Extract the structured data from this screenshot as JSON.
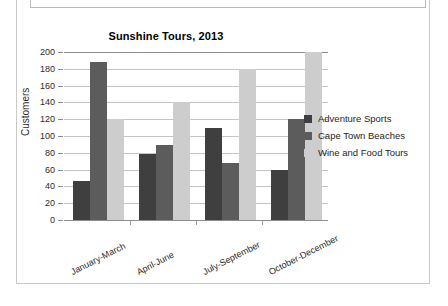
{
  "document": {
    "frame_label": "document-frame",
    "top_strip_label": "empty-text-box"
  },
  "chart_data": {
    "type": "bar",
    "title": "Sunshine Tours, 2013",
    "xlabel": "",
    "ylabel": "Customers",
    "ylim": [
      0,
      200
    ],
    "ytick_step": 20,
    "yticks": [
      "200",
      "180",
      "160",
      "140",
      "120",
      "100",
      "80",
      "60",
      "40",
      "20",
      "0"
    ],
    "grid": true,
    "legend_position": "right",
    "categories": [
      "January-March",
      "April-June",
      "July-September",
      "October-December"
    ],
    "series": [
      {
        "name": "Adventure Sports",
        "color": "#3f3f3f",
        "values": [
          46,
          78,
          109,
          59
        ]
      },
      {
        "name": "Cape Town Beaches",
        "color": "#5c5c5c",
        "values": [
          188,
          89,
          68,
          120
        ]
      },
      {
        "name": "Wine and Food Tours",
        "color": "#cdcdcd",
        "values": [
          120,
          140,
          180,
          200
        ]
      }
    ]
  }
}
